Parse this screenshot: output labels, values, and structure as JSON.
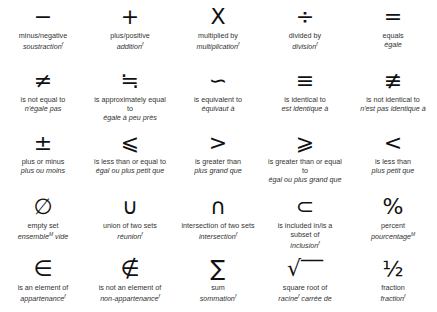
{
  "symbols": [
    {
      "glyph": "−",
      "en": "minus/negative",
      "fr": "soustraction",
      "g": "f"
    },
    {
      "glyph": "+",
      "en": "plus/positive",
      "fr": "addition",
      "g": "f"
    },
    {
      "glyph": "X",
      "en": "multiplied by",
      "fr": "multiplication",
      "g": "f"
    },
    {
      "glyph": "÷",
      "en": "divided by",
      "fr": "division",
      "g": "f"
    },
    {
      "glyph": "=",
      "en": "equals",
      "fr": "égale",
      "g": ""
    },
    {
      "glyph": "≠",
      "en": "is not equal to",
      "fr": "n'égale pas",
      "g": ""
    },
    {
      "glyph": "≒",
      "en": "is approximately equal\nto",
      "fr": "égale à peu près",
      "g": ""
    },
    {
      "glyph": "∽",
      "en": "is equivalent to",
      "fr": "équivaut à",
      "g": ""
    },
    {
      "glyph": "≡",
      "en": "is identical to",
      "fr": "est identique à",
      "g": ""
    },
    {
      "glyph": "≢",
      "en": "is not identical to",
      "fr": "n'est pas identique à",
      "g": ""
    },
    {
      "glyph": "±",
      "en": "plus or minus",
      "fr": "plus ou moins",
      "g": ""
    },
    {
      "glyph": "⩽",
      "en": "is less than or equal to",
      "fr": "égal ou plus petit que",
      "g": ""
    },
    {
      "glyph": ">",
      "en": "is greater than",
      "fr": "plus grand que",
      "g": ""
    },
    {
      "glyph": "⩾",
      "en": "is greater than or equal\nto",
      "fr": "égal ou plus grand que",
      "g": ""
    },
    {
      "glyph": "<",
      "en": "is less than",
      "fr": "plus petit que",
      "g": ""
    },
    {
      "glyph": "∅",
      "en": "empty set",
      "fr": "ensemble",
      "g": "M",
      "fr2": " vide"
    },
    {
      "glyph": "∪",
      "en": "union of two sets",
      "fr": "réunion",
      "g": "f"
    },
    {
      "glyph": "∩",
      "en": "intersection of two sets",
      "fr": "intersection",
      "g": "f"
    },
    {
      "glyph": "⊂",
      "en": "is included in/is a\nsubset of",
      "fr": "inclusion",
      "g": "f"
    },
    {
      "glyph": "%",
      "en": "percent",
      "fr": "pourcentage",
      "g": "M"
    },
    {
      "glyph": "∈",
      "en": "is an element of",
      "fr": "appartenance",
      "g": "f"
    },
    {
      "glyph": "∉",
      "en": "is not an element of",
      "fr": "non-appartenance",
      "g": "f"
    },
    {
      "glyph": "∑",
      "en": "sum",
      "fr": "sommation",
      "g": "f"
    },
    {
      "glyph": "√‾‾",
      "en": "square root of",
      "fr": "racine",
      "g": "f",
      "fr2": " carrée de"
    },
    {
      "glyph": "½",
      "en": "fraction",
      "fr": "fraction",
      "g": "f"
    }
  ]
}
